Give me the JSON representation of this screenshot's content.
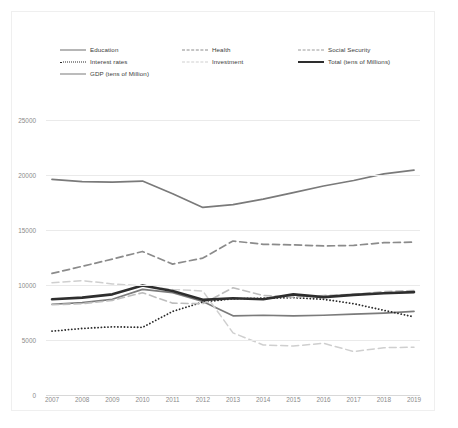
{
  "chart_data": {
    "type": "line",
    "title": "",
    "subtitle": "",
    "xlabel": "",
    "ylabel": "",
    "categories": [
      "2007",
      "2008",
      "2009",
      "2010",
      "2011",
      "2012",
      "2013",
      "2014",
      "2015",
      "2016",
      "2017",
      "2018",
      "2019"
    ],
    "x": [
      2007,
      2008,
      2009,
      2010,
      2011,
      2012,
      2013,
      2014,
      2015,
      2016,
      2017,
      2018,
      2019
    ],
    "ylim": [
      0,
      25000
    ],
    "yticks": [
      0,
      5000,
      10000,
      15000,
      20000,
      25000
    ],
    "ytick_labels": [
      "0",
      "5000",
      "10000",
      "15000",
      "20000",
      "25000"
    ],
    "grid": true,
    "legend_position": "top",
    "series": [
      {
        "name": "Education",
        "style": "solid",
        "color": "#7b7b7b",
        "width": 1.7,
        "values": [
          8250,
          8400,
          8700,
          9600,
          9300,
          8500,
          7200,
          7250,
          7200,
          7250,
          7350,
          7450,
          7600
        ]
      },
      {
        "name": "Interest rates",
        "style": "dotted",
        "color": "#2b2b2b",
        "width": 1.8,
        "values": [
          5800,
          6050,
          6200,
          6150,
          7600,
          8450,
          8750,
          8800,
          8850,
          8700,
          8300,
          7700,
          7100
        ]
      },
      {
        "name": "GDP (tens of Million)",
        "style": "solid",
        "color": "#7a7a7a",
        "width": 1.7,
        "values": [
          19600,
          19400,
          19350,
          19450,
          18300,
          17050,
          17300,
          17800,
          18400,
          19000,
          19500,
          20100,
          20450
        ]
      },
      {
        "name": "Health",
        "style": "dashed",
        "color": "#8b8b8b",
        "width": 1.7,
        "values": [
          11050,
          11700,
          12350,
          13050,
          11900,
          12450,
          14000,
          13700,
          13650,
          13550,
          13600,
          13850,
          13900
        ]
      },
      {
        "name": "Investment",
        "style": "dashed",
        "color": "#cfcfcf",
        "width": 1.5,
        "values": [
          10200,
          10400,
          10100,
          9900,
          9600,
          9450,
          5650,
          4550,
          4450,
          4700,
          3950,
          4300,
          4350
        ]
      },
      {
        "name": "Social Security",
        "style": "dashed",
        "color": "#bdbdbd",
        "width": 1.6,
        "values": [
          8200,
          8300,
          8600,
          9300,
          8350,
          8300,
          9750,
          9050,
          8900,
          9050,
          9150,
          9400,
          9500
        ]
      },
      {
        "name": "Total (tens of Millions)",
        "style": "solid",
        "color": "#2e2e2e",
        "width": 2.6,
        "values": [
          8700,
          8850,
          9150,
          9950,
          9450,
          8650,
          8800,
          8700,
          9150,
          8900,
          9100,
          9250,
          9350
        ]
      }
    ]
  },
  "legend": {
    "columns": [
      {
        "items": [
          {
            "label": "Education",
            "swatch": "sw-solid-dark"
          },
          {
            "label": "Interest rates",
            "swatch": "sw-dotted"
          },
          {
            "label": "GDP (tens of Million)",
            "swatch": "sw-solid-gdp"
          }
        ]
      },
      {
        "items": [
          {
            "label": "Health",
            "swatch": "sw-dash-mid"
          },
          {
            "label": "Investment",
            "swatch": "sw-dash-light"
          }
        ]
      },
      {
        "items": [
          {
            "label": "Social Security",
            "swatch": "sw-dash-ss"
          },
          {
            "label": "Total (tens of Millions)",
            "swatch": "sw-thick"
          }
        ]
      }
    ]
  }
}
